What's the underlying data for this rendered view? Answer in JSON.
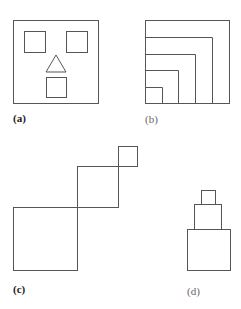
{
  "figures": [
    {
      "id": "a",
      "label": "(a)",
      "description": "square face with two square eyes, triangle nose, square mouth"
    },
    {
      "id": "b",
      "label": "(b)",
      "description": "nested squares sharing bottom-left corner"
    },
    {
      "id": "c",
      "label": "(c)",
      "description": "three squares decreasing in size arranged diagonally"
    },
    {
      "id": "d",
      "label": "(d)",
      "description": "three squares stacked vertically, decreasing in size"
    }
  ],
  "stroke_color": "#555555"
}
